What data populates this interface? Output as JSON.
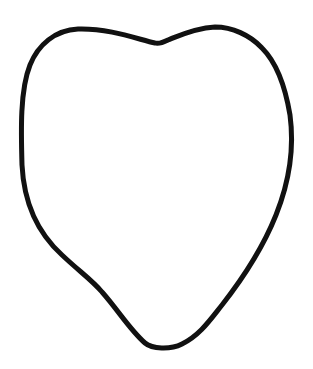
{
  "drawing": {
    "subject": "heart-shaped outline",
    "background_color": "#ffffff",
    "stroke_color": "#111111",
    "stroke_width": 5
  }
}
